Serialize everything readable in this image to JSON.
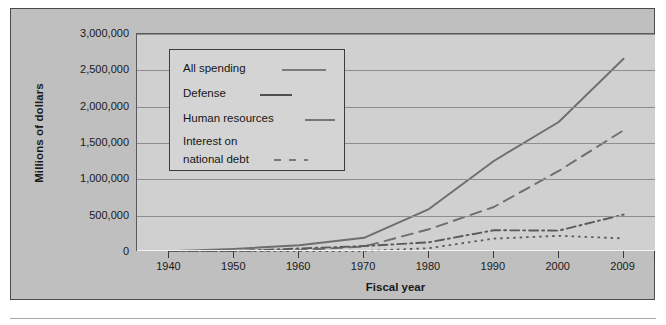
{
  "figure": {
    "ylabel": "Millions of dollars",
    "xlabel": "Fiscal year"
  },
  "legend": {
    "items": [
      {
        "label": "All spending",
        "style": "solid"
      },
      {
        "label": "Defense",
        "style": "dashdot"
      },
      {
        "label": "Human resources",
        "style": "dashed"
      },
      {
        "label_line1": "Interest on",
        "label_line2": "national debt",
        "style": "dotted"
      }
    ]
  },
  "chart_data": {
    "type": "line",
    "title": "",
    "xlabel": "Fiscal year",
    "ylabel": "Millions of dollars",
    "x": [
      1940,
      1950,
      1960,
      1970,
      1980,
      1990,
      2000,
      2009
    ],
    "xtick_labels": [
      "1940",
      "1950",
      "1960",
      "1970",
      "1980",
      "1990",
      "2000",
      "2009"
    ],
    "ytick_labels": [
      "0",
      "500,000",
      "1,000,000",
      "1,500,000",
      "2,000,000",
      "2,500,000",
      "3,000,000"
    ],
    "yticks": [
      0,
      500000,
      1000000,
      1500000,
      2000000,
      2500000,
      3000000
    ],
    "ylim": [
      0,
      3000000
    ],
    "xlim": [
      1940,
      2009
    ],
    "grid": true,
    "legend_position": "upper-left-inside",
    "series": [
      {
        "name": "All spending",
        "style": "solid",
        "color": "#6e6e6e",
        "values": [
          9500,
          42600,
          92200,
          195600,
          590900,
          1253000,
          1789000,
          2659000
        ]
      },
      {
        "name": "Human resources",
        "style": "dashed",
        "color": "#6e6e6e",
        "values": [
          4100,
          14200,
          26200,
          75300,
          313400,
          619300,
          1115500,
          1675000
        ]
      },
      {
        "name": "Defense",
        "style": "dashdot",
        "color": "#5a5a5a",
        "values": [
          1700,
          13700,
          48100,
          81700,
          134000,
          299300,
          294400,
          515000
        ]
      },
      {
        "name": "Interest on national debt",
        "style": "dotted",
        "color": "#5a5a5a",
        "values": [
          900,
          4800,
          6900,
          14400,
          52500,
          184200,
          222900,
          187000
        ]
      }
    ]
  }
}
